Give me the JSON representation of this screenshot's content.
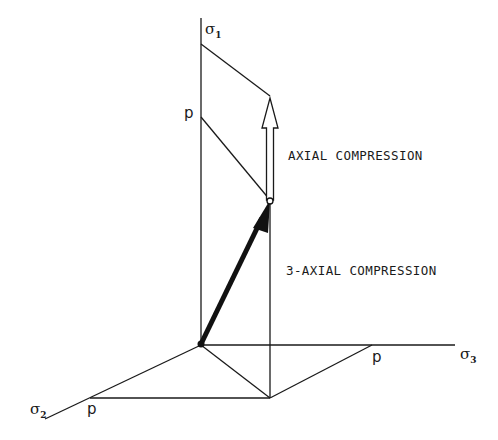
{
  "diagram": {
    "type": "principal stress space (3D isometric)",
    "axes": [
      {
        "id": "sigma1",
        "symbol": "σ",
        "subscript": "1",
        "direction": "vertical"
      },
      {
        "id": "sigma2",
        "symbol": "σ",
        "subscript": "2",
        "direction": "lower-left"
      },
      {
        "id": "sigma3",
        "symbol": "σ",
        "subscript": "3",
        "direction": "right"
      }
    ],
    "p_labels": {
      "sigma1": "p",
      "sigma2": "p",
      "sigma3": "p"
    },
    "annotations": {
      "axial": "AXIAL COMPRESSION",
      "triaxial": "3-AXIAL COMPRESSION"
    },
    "colors": {
      "line": "#1a1a1a",
      "background": "#ffffff"
    }
  }
}
